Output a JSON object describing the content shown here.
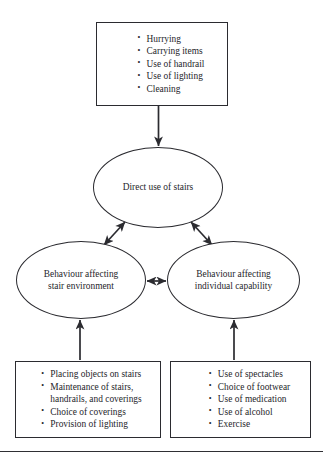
{
  "diagram": {
    "type": "flowchart",
    "orientation": "vertical",
    "line_color": "#2b2b30",
    "text_color": "#26262b",
    "background": "#ffffff",
    "nodes": {
      "top_factors": {
        "shape": "rectangle",
        "items": [
          "Hurrying",
          "Carrying items",
          "Use of handrail",
          "Use of lighting",
          "Cleaning"
        ]
      },
      "direct_use": {
        "shape": "ellipse",
        "label": "Direct use of stairs"
      },
      "stair_environment": {
        "shape": "ellipse",
        "label": "Behaviour affecting\nstair environment"
      },
      "individual_capability": {
        "shape": "ellipse",
        "label": "Behaviour affecting\nindividual capability"
      },
      "environment_factors": {
        "shape": "rectangle",
        "items": [
          "Placing objects on stairs",
          "Maintenance of stairs,\nhandrails, and coverings",
          "Choice of coverings",
          "Provision of lighting"
        ]
      },
      "capability_factors": {
        "shape": "rectangle",
        "items": [
          "Use of spectacles",
          "Choice of footwear",
          "Use of medication",
          "Use of alcohol",
          "Exercise"
        ]
      }
    },
    "connectors": [
      {
        "from": "top_factors",
        "to": "direct_use",
        "arrow": "single",
        "direction": "down"
      },
      {
        "from": "direct_use",
        "to": "stair_environment",
        "arrow": "double",
        "direction": "diagonal-left"
      },
      {
        "from": "direct_use",
        "to": "individual_capability",
        "arrow": "double",
        "direction": "diagonal-right"
      },
      {
        "from": "stair_environment",
        "to": "individual_capability",
        "arrow": "double",
        "direction": "horizontal"
      },
      {
        "from": "environment_factors",
        "to": "stair_environment",
        "arrow": "single",
        "direction": "up"
      },
      {
        "from": "capability_factors",
        "to": "individual_capability",
        "arrow": "single",
        "direction": "up"
      }
    ]
  }
}
